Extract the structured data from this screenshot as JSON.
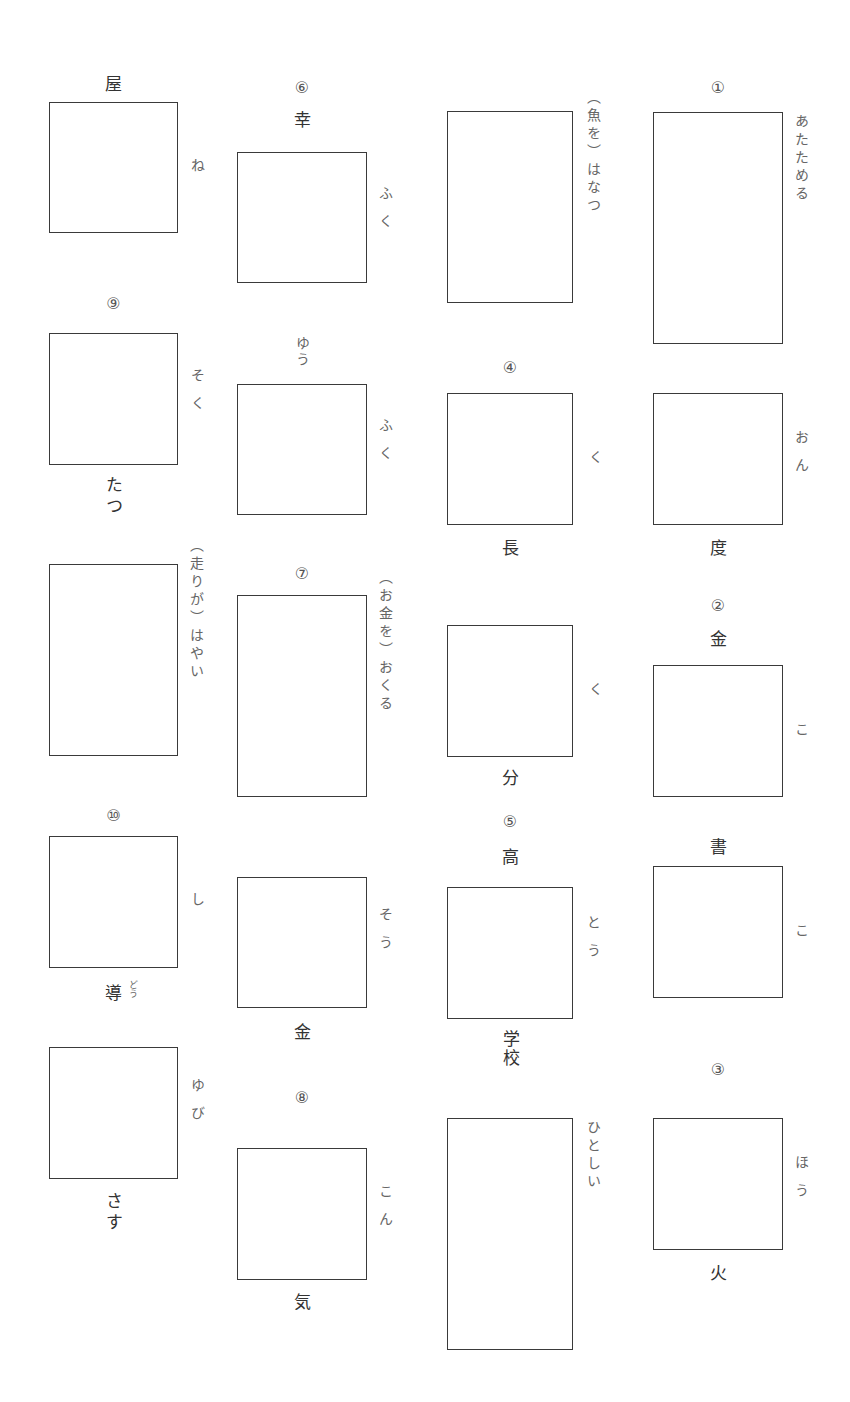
{
  "worksheet": {
    "numbers": [
      "①",
      "②",
      "③",
      "④",
      "⑤",
      "⑥",
      "⑦",
      "⑧",
      "⑨",
      "⑩"
    ],
    "col4": {
      "q1": {
        "num": "①",
        "reading": "あたためる"
      },
      "b2": {
        "reading": "おん",
        "below": "度"
      },
      "q2": {
        "num": "②",
        "above": "金",
        "reading": "こ"
      },
      "b4": {
        "above": "書",
        "reading": "こ"
      },
      "q3": {
        "num": "③",
        "reading": "ほう",
        "below": "火"
      }
    },
    "col3": {
      "b1": {
        "reading": "（魚を）はなつ"
      },
      "q4": {
        "num": "④",
        "reading": "く",
        "below": "長"
      },
      "b3": {
        "reading": "く",
        "below": "分"
      },
      "q5": {
        "num": "⑤",
        "above": "高",
        "reading": "とう",
        "below": "学校"
      },
      "b5": {
        "reading": "ひとしい"
      }
    },
    "col2": {
      "q6": {
        "num": "⑥",
        "above": "幸",
        "reading": "ふく"
      },
      "b2": {
        "above_reading": "ゆう",
        "reading": "ふく"
      },
      "q7": {
        "num": "⑦",
        "reading": "（お金を）おくる"
      },
      "b4": {
        "reading": "そう",
        "below": "金"
      },
      "q8": {
        "num": "⑧",
        "reading": "こん",
        "below": "気"
      }
    },
    "col1": {
      "b1": {
        "above": "屋",
        "reading": "ね"
      },
      "q9": {
        "num": "⑨",
        "reading": "そく",
        "below": "たつ"
      },
      "b3": {
        "reading": "（走りが）はやい"
      },
      "q10": {
        "num": "⑩",
        "reading": "し",
        "below": "導",
        "below_ruby": "どう"
      },
      "b5": {
        "reading": "ゆび",
        "below": "さす"
      }
    }
  }
}
